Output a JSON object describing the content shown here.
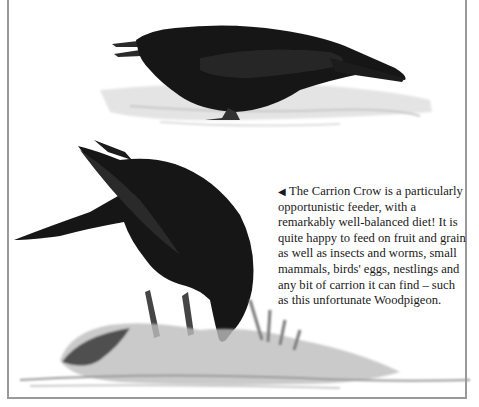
{
  "page": {
    "caption": {
      "pointer": "◀",
      "text": "The Carrion Crow is a particularly opportunistic feeder, with a remarkably well-balanced diet! It is quite happy to feed on fruit and grain as well as insects and worms, small mammals, birds' eggs, nestlings and any bit of carrion it can find – such as this unfortunate Woodpigeon."
    },
    "illustrations": [
      {
        "subject": "carrion-crow-standing"
      },
      {
        "subject": "carrion-crow-feeding-on-woodpigeon"
      }
    ],
    "colors": {
      "frame": "#9a9a9a",
      "crow": "#141414",
      "ground": "#c8c8c8",
      "text": "#1a1a1a"
    }
  }
}
